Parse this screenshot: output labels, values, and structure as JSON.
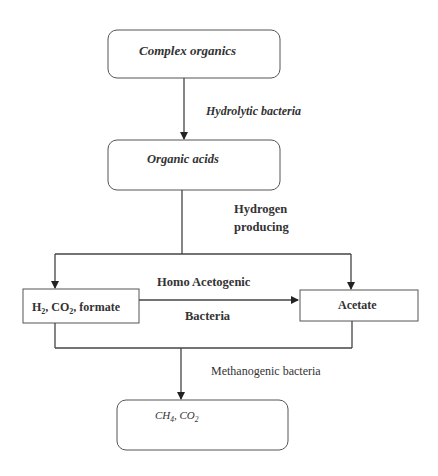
{
  "diagram": {
    "type": "flowchart",
    "colors": {
      "line": "#444444",
      "box_border": "#555555",
      "text": "#333333",
      "background": "#ffffff"
    },
    "nodes": {
      "complex_organics": {
        "label": "Complex organics",
        "shape": "rounded-rect"
      },
      "organic_acids": {
        "label": "Organic acids",
        "shape": "rounded-rect"
      },
      "h2_co2_formate": {
        "label_parts": [
          "H",
          "2",
          ", CO",
          "2",
          ", formate"
        ],
        "label": "H2, CO2, formate",
        "shape": "rect"
      },
      "acetate": {
        "label": "Acetate",
        "shape": "rect"
      },
      "ch4_co2": {
        "label_parts": [
          "CH",
          "4",
          ", CO",
          "2"
        ],
        "label": "CH4, CO2",
        "shape": "rounded-rect"
      }
    },
    "edge_labels": {
      "hydrolytic": "Hydrolytic bacteria",
      "hydrogen_producing_line1": "Hydrogen",
      "hydrogen_producing_line2": "producing",
      "homo_acetogenic": "Homo Acetogenic",
      "bacteria": "Bacteria",
      "methanogenic": "Methanogenic bacteria"
    },
    "edges": [
      {
        "from": "complex_organics",
        "to": "organic_acids",
        "label": "Hydrolytic bacteria"
      },
      {
        "from": "organic_acids",
        "to": "h2_co2_formate",
        "label": "Hydrogen producing"
      },
      {
        "from": "organic_acids",
        "to": "acetate",
        "label": "Hydrogen producing"
      },
      {
        "from": "h2_co2_formate",
        "to": "acetate",
        "label": "Homo Acetogenic Bacteria"
      },
      {
        "from": "h2_co2_formate",
        "to": "ch4_co2",
        "label": "Methanogenic bacteria"
      },
      {
        "from": "acetate",
        "to": "ch4_co2",
        "label": "Methanogenic bacteria"
      }
    ]
  }
}
